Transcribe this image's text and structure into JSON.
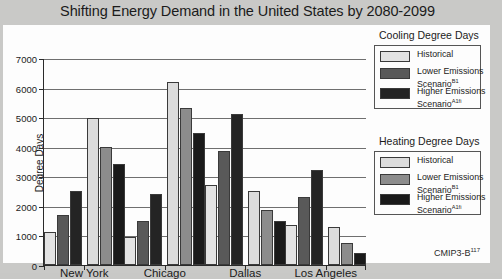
{
  "title": "Shifting Energy Demand in the United States by 2080-2099",
  "source": "CMIP3-B",
  "source_superscript": "117",
  "axes": {
    "ylabel": "Degree Days",
    "yticks": [
      0,
      1000,
      2000,
      3000,
      4000,
      5000,
      6000,
      7000
    ],
    "ylim": [
      0,
      7000
    ],
    "categories": [
      "New York",
      "Chicago",
      "Dallas",
      "Los Angeles"
    ]
  },
  "legends": [
    {
      "title": "Cooling Degree Days",
      "items": [
        {
          "label": "Historical",
          "sup": "",
          "color": "#e3e3e3"
        },
        {
          "label": "Lower Emissions Scenario",
          "sup": "B1",
          "color": "#595959"
        },
        {
          "label": "Higher Emissions Scenario",
          "sup": "A1fi",
          "color": "#242424"
        }
      ]
    },
    {
      "title": "Heating Degree Days",
      "items": [
        {
          "label": "Historical",
          "sup": "",
          "color": "#dcdcdc"
        },
        {
          "label": "Lower Emissions Scenario",
          "sup": "B1",
          "color": "#8c8c8c"
        },
        {
          "label": "Higher Emissions Scenario",
          "sup": "A1fi",
          "color": "#1a1a1a"
        }
      ]
    }
  ],
  "chart_data": {
    "type": "bar",
    "title": "Shifting Energy Demand in the United States by 2080-2099",
    "xlabel": "",
    "ylabel": "Degree Days",
    "ylim": [
      0,
      7000
    ],
    "grid": true,
    "legend_position": "right",
    "categories": [
      "New York",
      "Chicago",
      "Dallas",
      "Los Angeles"
    ],
    "series": [
      {
        "name": "Cooling Degree Days – Historical",
        "color": "#e3e3e3",
        "values": [
          1100,
          950,
          2700,
          1350
        ]
      },
      {
        "name": "Cooling Degree Days – Lower Emissions Scenario (B1)",
        "color": "#595959",
        "values": [
          1700,
          1500,
          3850,
          2300
        ]
      },
      {
        "name": "Cooling Degree Days – Higher Emissions Scenario (A1fi)",
        "color": "#242424",
        "values": [
          2500,
          2400,
          5100,
          3200
        ]
      },
      {
        "name": "Heating Degree Days – Historical",
        "color": "#dcdcdc",
        "values": [
          4980,
          6200,
          2500,
          1300
        ]
      },
      {
        "name": "Heating Degree Days – Lower Emissions Scenario (B1)",
        "color": "#8c8c8c",
        "values": [
          4000,
          5300,
          1850,
          750
        ]
      },
      {
        "name": "Heating Degree Days – Higher Emissions Scenario (A1fi)",
        "color": "#1a1a1a",
        "values": [
          3400,
          4450,
          1500,
          400
        ]
      }
    ]
  }
}
